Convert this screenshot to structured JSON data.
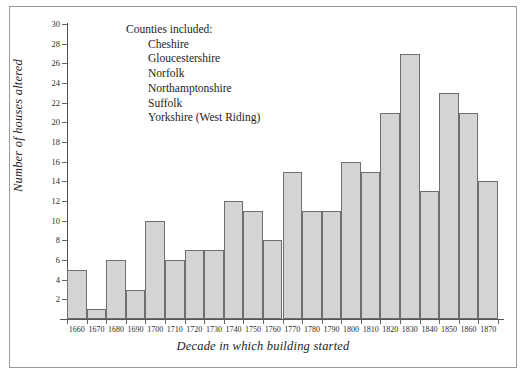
{
  "chart_data": {
    "type": "bar",
    "title": "",
    "xlabel": "Decade in which building started",
    "ylabel": "Number of houses altered",
    "categories": [
      "1660",
      "1670",
      "1680",
      "1690",
      "1700",
      "1710",
      "1720",
      "1730",
      "1740",
      "1750",
      "1760",
      "1770",
      "1780",
      "1790",
      "1800",
      "1810",
      "1820",
      "1830",
      "1840",
      "1850",
      "1860",
      "1870"
    ],
    "values": [
      5,
      1,
      6,
      3,
      10,
      6,
      7,
      7,
      12,
      11,
      8,
      15,
      11,
      11,
      16,
      15,
      21,
      27,
      13,
      23,
      21,
      14
    ],
    "ylim": [
      0,
      30
    ],
    "ytick_values": [
      2,
      4,
      6,
      8,
      10,
      12,
      14,
      16,
      18,
      20,
      22,
      24,
      26,
      28,
      30
    ],
    "ytick_labels": [
      "2",
      "4",
      "6",
      "8",
      "10",
      "12",
      "14",
      "16",
      "18",
      "20",
      "22",
      "24",
      "26",
      "28",
      "30"
    ],
    "grid": false,
    "legend_position": "none",
    "bar_color": "#d4d4d4",
    "bar_edge_color": "#6f6f6f",
    "annotation": {
      "heading": "Counties included:",
      "items": [
        "Cheshire",
        "Gloucestershire",
        "Norfolk",
        "Northamptonshire",
        "Suffolk",
        "Yorkshire (West Riding)"
      ]
    }
  }
}
